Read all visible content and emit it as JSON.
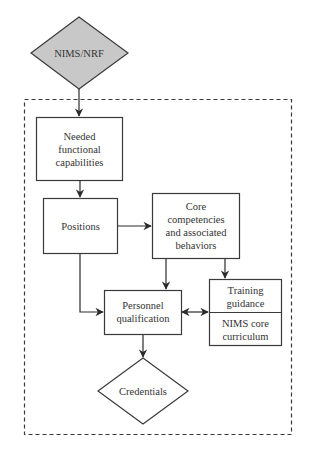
{
  "diagram": {
    "colors": {
      "stroke": "#3a3a3a",
      "diamond_fill_top": "#c8c8c8",
      "box_fill": "#ffffff",
      "text": "#333333"
    },
    "nodes": {
      "nims_nrf": {
        "shape": "diamond",
        "lines": [
          "NIMS/NRF"
        ]
      },
      "needed": {
        "shape": "box",
        "lines": [
          "Needed",
          "functional",
          "capabilities"
        ]
      },
      "positions": {
        "shape": "box",
        "lines": [
          "Positions"
        ]
      },
      "core": {
        "shape": "box",
        "lines": [
          "Core",
          "competencies",
          "and associated",
          "behaviors"
        ]
      },
      "personnel": {
        "shape": "box",
        "lines": [
          "Personnel",
          "qualification"
        ]
      },
      "training": {
        "shape": "box",
        "lines": [
          "Training",
          "guidance"
        ]
      },
      "nims_core": {
        "shape": "box",
        "lines": [
          "NIMS core",
          "curriculum"
        ]
      },
      "credentials": {
        "shape": "diamond",
        "lines": [
          "Credentials"
        ]
      }
    },
    "edges": [
      {
        "from": "nims_nrf",
        "to": "needed"
      },
      {
        "from": "needed",
        "to": "positions"
      },
      {
        "from": "positions",
        "to": "core"
      },
      {
        "from": "positions",
        "to": "personnel"
      },
      {
        "from": "core",
        "to": "personnel"
      },
      {
        "from": "core",
        "to": "training"
      },
      {
        "from": "personnel",
        "to": "training",
        "bidirectional": true
      },
      {
        "from": "personnel",
        "to": "credentials"
      }
    ],
    "container": {
      "style": "dashed"
    }
  }
}
